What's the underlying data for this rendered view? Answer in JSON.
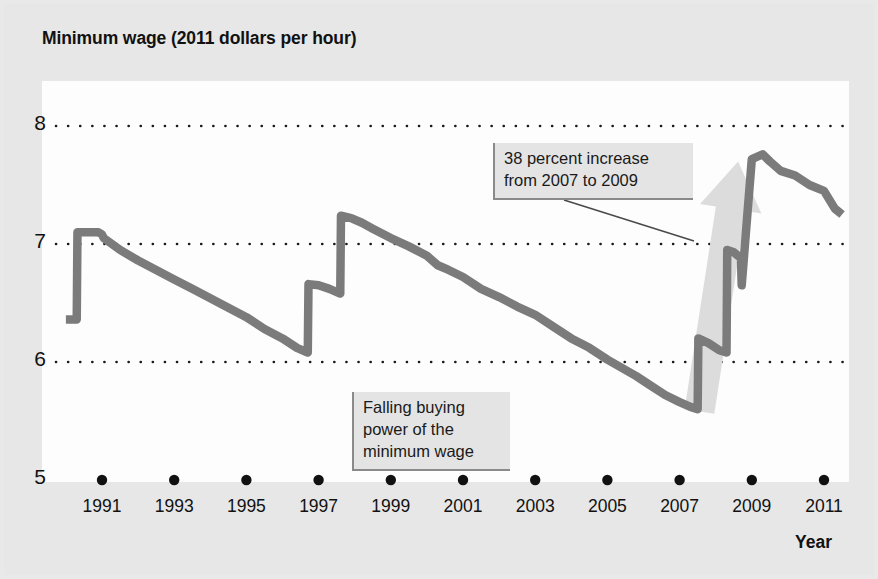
{
  "figure": {
    "title": "Minimum wage (2011 dollars per hour)",
    "axis_title_x": "Year",
    "line_color": "#7b7b7b",
    "arrow_color": "#dcdcdc",
    "gridline_color": "#1a1a1a",
    "plot_background": "#fdfdfd",
    "figure_background": "#e7e7e7"
  },
  "annotations": {
    "increase": "38 percent increase\nfrom 2007 to 2009",
    "falling": "Falling buying\npower of the\nminimum wage"
  },
  "chart_data": {
    "type": "line",
    "title": "Minimum wage (2011 dollars per hour)",
    "xlabel": "Year",
    "ylabel": "Minimum wage (2011 dollars per hour)",
    "xlim": [
      1990.0,
      2011.6
    ],
    "ylim": [
      5,
      8
    ],
    "grid": true,
    "gridlines_y": [
      6,
      7,
      8
    ],
    "y_ticks": [
      "5",
      "6",
      "7",
      "8"
    ],
    "x_ticks": [
      "1991",
      "1993",
      "1995",
      "1997",
      "1999",
      "2001",
      "2003",
      "2005",
      "2007",
      "2009",
      "2011"
    ],
    "x_tick_values": [
      1991,
      1993,
      1995,
      1997,
      1999,
      2001,
      2003,
      2005,
      2007,
      2009,
      2011
    ],
    "legend": null,
    "series": [
      {
        "name": "Real minimum wage",
        "x": [
          1990.0,
          1990.3,
          1990.32,
          1990.9,
          1991.0,
          1991.05,
          1991.5,
          1992.0,
          1992.5,
          1993.0,
          1993.5,
          1994.0,
          1994.5,
          1995.0,
          1995.5,
          1996.0,
          1996.4,
          1996.7,
          1996.72,
          1997.0,
          1997.3,
          1997.6,
          1997.62,
          1997.9,
          1998.2,
          1998.5,
          1999.0,
          1999.5,
          2000.0,
          2000.3,
          2000.6,
          2001.0,
          2001.5,
          2002.0,
          2002.5,
          2003.0,
          2003.5,
          2004.0,
          2004.5,
          2005.0,
          2005.4,
          2005.8,
          2006.2,
          2006.6,
          2007.0,
          2007.3,
          2007.5,
          2007.52,
          2007.8,
          2008.1,
          2008.3,
          2008.32,
          2008.5,
          2008.7,
          2008.72,
          2009.0,
          2009.3,
          2009.5,
          2009.8,
          2010.2,
          2010.6,
          2011.0,
          2011.3,
          2011.5
        ],
        "y": [
          6.36,
          6.36,
          7.1,
          7.1,
          7.08,
          7.05,
          6.95,
          6.86,
          6.78,
          6.7,
          6.62,
          6.54,
          6.46,
          6.38,
          6.28,
          6.2,
          6.12,
          6.08,
          6.66,
          6.65,
          6.62,
          6.58,
          7.24,
          7.22,
          7.18,
          7.13,
          7.05,
          6.98,
          6.9,
          6.82,
          6.78,
          6.72,
          6.62,
          6.55,
          6.47,
          6.4,
          6.3,
          6.2,
          6.12,
          6.02,
          5.95,
          5.88,
          5.8,
          5.72,
          5.66,
          5.62,
          5.6,
          6.2,
          6.16,
          6.1,
          6.08,
          6.95,
          6.93,
          6.88,
          6.65,
          7.72,
          7.76,
          7.7,
          7.62,
          7.58,
          7.5,
          7.45,
          7.3,
          7.25
        ],
        "color": "#7b7b7b"
      }
    ],
    "annotations": [
      {
        "text": "38 percent increase from 2007 to 2009",
        "x": 2008.4,
        "y": 7.55,
        "kind": "callout-with-leader-line"
      },
      {
        "text": "Falling buying power of the minimum wage",
        "x": 2001.5,
        "y": 5.75,
        "kind": "callout"
      },
      {
        "text": "",
        "kind": "arrow",
        "from_x": 2007.5,
        "from_y": 5.6,
        "to_x": 2008.6,
        "to_y": 7.72,
        "color": "#dcdcdc"
      }
    ]
  }
}
